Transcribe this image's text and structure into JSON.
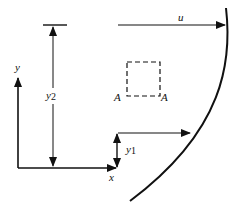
{
  "diagram": {
    "labels": {
      "y_axis": "y",
      "x_axis": "x",
      "y2": "y",
      "y2_sub": "2",
      "y1": "y",
      "y1_sub": "1",
      "u": "u",
      "a_left": "A",
      "a_right": "A"
    },
    "colors": {
      "stroke": "#111111",
      "background": "#ffffff"
    }
  }
}
